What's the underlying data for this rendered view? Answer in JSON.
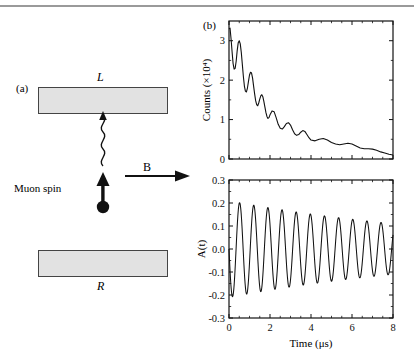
{
  "figure": {
    "panel_a": {
      "tag": "(a)",
      "detector_top_label": "L",
      "detector_bottom_label": "R",
      "field_label": "B",
      "muon_label": "Muon spin",
      "detector_fill": "#e2e2e2",
      "detector_stroke": "#444444"
    },
    "panel_b": {
      "tag": "(b)"
    }
  },
  "chart_data": [
    {
      "id": "counts-plot",
      "type": "line",
      "title": "",
      "xlabel": "",
      "ylabel": "Counts (×10⁴)",
      "xlim": [
        0,
        8
      ],
      "ylim": [
        0,
        3.5
      ],
      "xticks": [
        0,
        2,
        4,
        6,
        8
      ],
      "xticklabels": [
        "",
        "",
        "",
        "",
        ""
      ],
      "yticks": [
        0,
        1,
        2,
        3
      ],
      "yticklabels": [
        "0",
        "1",
        "2",
        "3"
      ],
      "grid": false,
      "legend": "none",
      "series": [
        {
          "name": "positron counts",
          "x": [
            0.0,
            0.05,
            0.1,
            0.15,
            0.2,
            0.25,
            0.3,
            0.35,
            0.4,
            0.45,
            0.5,
            0.55,
            0.6,
            0.65,
            0.7,
            0.75,
            0.8,
            0.85,
            0.9,
            0.95,
            1.0,
            1.05,
            1.1,
            1.15,
            1.2,
            1.25,
            1.3,
            1.35,
            1.4,
            1.45,
            1.5,
            1.55,
            1.6,
            1.65,
            1.7,
            1.75,
            1.8,
            1.85,
            1.9,
            1.95,
            2.0,
            2.1,
            2.2,
            2.3,
            2.4,
            2.5,
            2.6,
            2.7,
            2.8,
            2.9,
            3.0,
            3.1,
            3.2,
            3.3,
            3.4,
            3.5,
            3.6,
            3.7,
            3.8,
            3.9,
            4.0,
            4.2,
            4.4,
            4.6,
            4.8,
            5.0,
            5.2,
            5.4,
            5.6,
            5.8,
            6.0,
            6.2,
            6.4,
            6.6,
            6.8,
            7.0,
            7.2,
            7.4,
            7.6,
            7.8,
            8.0
          ],
          "y": [
            3.3,
            3.32,
            3.05,
            2.72,
            2.42,
            2.28,
            2.3,
            2.48,
            2.75,
            2.95,
            3.0,
            2.92,
            2.7,
            2.4,
            2.1,
            1.85,
            1.72,
            1.7,
            1.8,
            1.97,
            2.13,
            2.2,
            2.18,
            2.05,
            1.85,
            1.65,
            1.48,
            1.38,
            1.35,
            1.42,
            1.52,
            1.6,
            1.63,
            1.58,
            1.46,
            1.32,
            1.18,
            1.08,
            1.03,
            1.05,
            1.12,
            1.22,
            1.2,
            1.05,
            0.88,
            0.78,
            0.76,
            0.82,
            0.9,
            0.92,
            0.86,
            0.74,
            0.64,
            0.6,
            0.62,
            0.68,
            0.72,
            0.7,
            0.62,
            0.54,
            0.48,
            0.46,
            0.5,
            0.52,
            0.48,
            0.42,
            0.38,
            0.36,
            0.38,
            0.4,
            0.38,
            0.33,
            0.28,
            0.26,
            0.26,
            0.25,
            0.22,
            0.18,
            0.15,
            0.12,
            0.1
          ]
        }
      ]
    },
    {
      "id": "asymmetry-plot",
      "type": "line",
      "title": "",
      "xlabel": "Time (μs)",
      "ylabel": "A(t)",
      "xlim": [
        0,
        8
      ],
      "ylim": [
        -0.3,
        0.3
      ],
      "xticks": [
        0,
        2,
        4,
        6,
        8
      ],
      "xticklabels": [
        "0",
        "2",
        "4",
        "6",
        "8"
      ],
      "yticks": [
        -0.3,
        -0.2,
        -0.1,
        0.0,
        0.1,
        0.2,
        0.3
      ],
      "yticklabels": [
        "-0.3",
        "-0.2",
        "-0.1",
        "0.0",
        "0.1",
        "0.2",
        "0.3"
      ],
      "grid": false,
      "legend": "none",
      "series": [
        {
          "name": "asymmetry",
          "description": "Damped cosine, amplitude 0.21 decaying to 0.11, frequency ~1.45 MHz (period ~0.69 us), starting near 0 then dipping negative",
          "amplitude_initial": 0.21,
          "amplitude_final": 0.11,
          "period_us": 0.69,
          "phase": "starts at 0, first minimum near t=0.2"
        }
      ]
    }
  ]
}
